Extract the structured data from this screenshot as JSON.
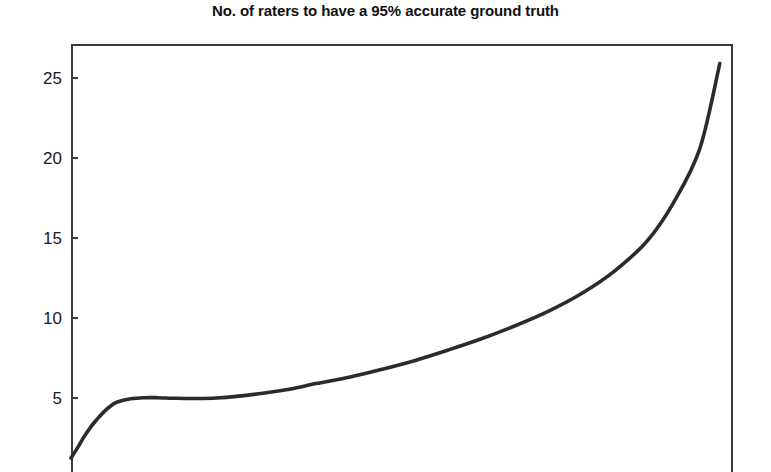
{
  "chart": {
    "title": "No. of raters to have a 95% accurate ground truth",
    "line_color": "#2b2b2b",
    "frame_color": "#3a3a3a",
    "background": "#ffffff"
  },
  "chart_data": {
    "type": "line",
    "title": "No. of raters to have a 95% accurate ground truth",
    "subtitle": "",
    "xlabel": "",
    "ylabel": "",
    "grid": false,
    "legend": null,
    "ylim": [
      0,
      27
    ],
    "yticks": [
      5,
      10,
      15,
      20,
      25
    ],
    "ytick_labels": [
      "5",
      "10",
      "15",
      "20",
      "25"
    ],
    "xticks": [],
    "xtick_labels": [],
    "note": "x-axis is cropped off the bottom of the screenshot; x values are normalized 0-1 across the plot width",
    "series": [
      {
        "name": "No. of raters",
        "x": [
          0.0,
          0.01,
          0.02,
          0.03,
          0.04,
          0.05,
          0.06,
          0.07,
          0.09,
          0.11,
          0.13,
          0.16,
          0.19,
          0.22,
          0.25,
          0.29,
          0.33,
          0.37,
          0.42,
          0.47,
          0.52,
          0.57,
          0.62,
          0.67,
          0.72,
          0.77,
          0.82,
          0.87,
          0.91,
          0.95,
          0.98
        ],
        "y": [
          1.25,
          1.9,
          2.6,
          3.2,
          3.7,
          4.15,
          4.5,
          4.75,
          4.95,
          5.02,
          5.02,
          4.98,
          4.97,
          5.0,
          5.1,
          5.3,
          5.55,
          5.9,
          6.3,
          6.8,
          7.35,
          8.0,
          8.7,
          9.5,
          10.4,
          11.5,
          12.9,
          14.8,
          17.2,
          20.6,
          25.9
        ]
      }
    ]
  },
  "y_axis": {
    "ticks": [
      {
        "label": "25",
        "value": 25
      },
      {
        "label": "20",
        "value": 20
      },
      {
        "label": "15",
        "value": 15
      },
      {
        "label": "10",
        "value": 10
      },
      {
        "label": "5",
        "value": 5
      }
    ]
  }
}
